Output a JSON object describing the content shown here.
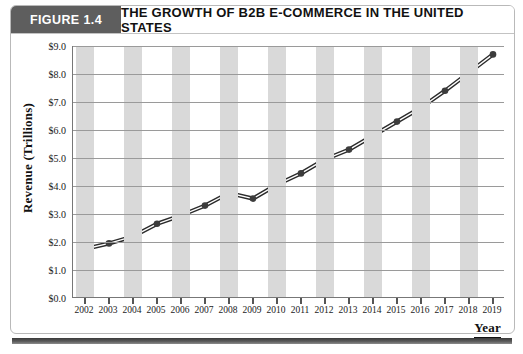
{
  "figure": {
    "tag": "FIGURE 1.4",
    "title": "THE GROWTH OF B2B E-COMMERCE IN THE UNITED STATES"
  },
  "colors": {
    "tag_background": "#5e5e5e",
    "tag_text": "#ffffff",
    "band": "#d9d9d9",
    "gridline": "#9a9a9a",
    "line": "#2b2b2b",
    "marker": "#3c3c3c",
    "frame": "#b9b9b9",
    "bottom_bar": "#4a4a4a"
  },
  "chart_data": {
    "type": "line",
    "title": "THE GROWTH OF B2B E-COMMERCE IN THE UNITED STATES",
    "xlabel": "Year",
    "ylabel": "Revenue (Trillions)",
    "categories": [
      "2002",
      "2003",
      "2004",
      "2005",
      "2006",
      "2007",
      "2008",
      "2009",
      "2010",
      "2011",
      "2012",
      "2013",
      "2014",
      "2015",
      "2016",
      "2017",
      "2018",
      "2019"
    ],
    "values": [
      1.75,
      1.95,
      2.2,
      2.65,
      2.95,
      3.3,
      3.75,
      3.55,
      4.05,
      4.45,
      4.95,
      5.3,
      5.8,
      6.3,
      6.8,
      7.4,
      8.05,
      8.7
    ],
    "ylim": [
      0.0,
      9.0
    ],
    "ytick_values": [
      0.0,
      1.0,
      2.0,
      3.0,
      4.0,
      5.0,
      6.0,
      7.0,
      8.0,
      9.0
    ],
    "ytick_labels": [
      "$0.0",
      "$1.0",
      "$2.0",
      "$3.0",
      "$4.0",
      "$5.0",
      "$6.0",
      "$7.0",
      "$8.0",
      "$9.0"
    ],
    "grid": true,
    "grid_axis": "y",
    "legend": false,
    "marker": "circle",
    "line_style": "double-stroke",
    "background_bands": "alternating-vertical"
  }
}
